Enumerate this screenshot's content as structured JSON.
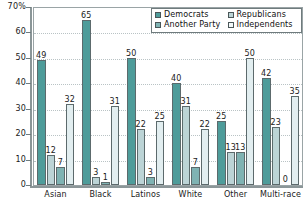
{
  "chart_data": {
    "type": "bar",
    "title": "",
    "subtitle": "",
    "xlabel": "",
    "ylabel": "",
    "ylim": [
      0,
      70
    ],
    "y_ticks": [
      "0",
      "10",
      "20",
      "30",
      "40",
      "50",
      "60",
      "70%"
    ],
    "y_tick_values": [
      0,
      10,
      20,
      30,
      40,
      50,
      60,
      70
    ],
    "grid": true,
    "legend_position": "top-right",
    "categories": [
      "Asian",
      "Black",
      "Latinos",
      "White",
      "Other",
      "Multi-race"
    ],
    "series": [
      {
        "name": "Democrats",
        "color": "#4e9c9a",
        "values": [
          49,
          65,
          50,
          40,
          25,
          42
        ]
      },
      {
        "name": "Republicans",
        "color": "#bcd4d6",
        "values": [
          12,
          3,
          22,
          31,
          13,
          23
        ]
      },
      {
        "name": "Another Party",
        "color": "#7fb3b3",
        "values": [
          7,
          1,
          3,
          7,
          13,
          0
        ]
      },
      {
        "name": "Independents",
        "color": "#e2eef0",
        "values": [
          32,
          31,
          25,
          22,
          50,
          35
        ]
      }
    ]
  },
  "legend": {
    "entries": [
      {
        "label": "Democrats"
      },
      {
        "label": "Republicans"
      },
      {
        "label": "Another Party"
      },
      {
        "label": "Independents"
      }
    ]
  }
}
